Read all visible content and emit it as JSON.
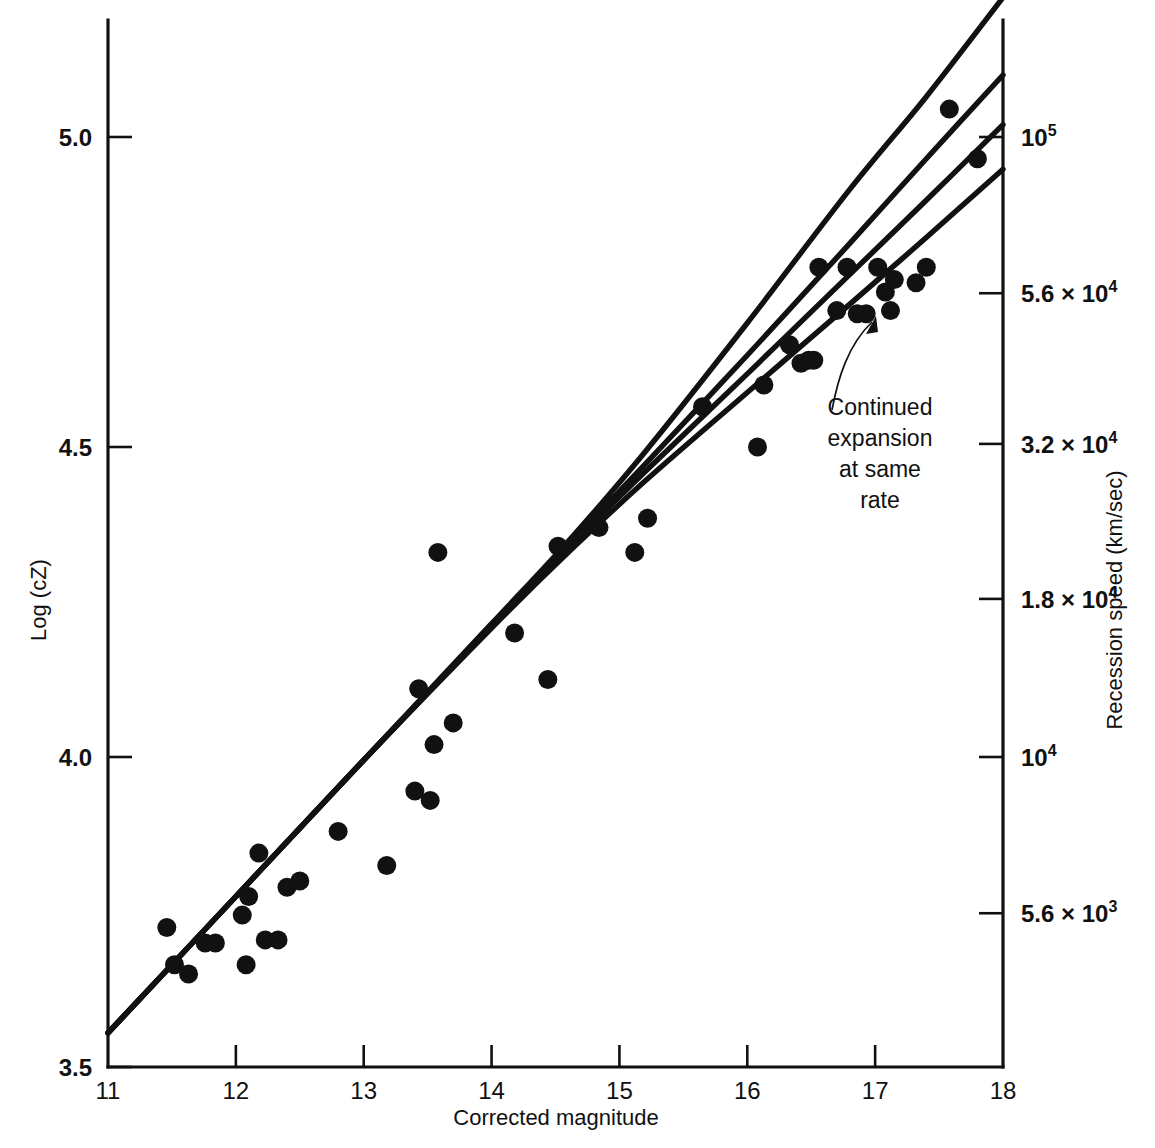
{
  "chart_data": {
    "type": "scatter",
    "title": "",
    "xlabel": "Corrected magnitude",
    "ylabel": "Log (cZ)",
    "ylabel_right": "Recession speed (km/sec)",
    "xlim": [
      11,
      18
    ],
    "ylim": [
      3.5,
      5.15
    ],
    "grid": false,
    "legend_position": "none",
    "xticks": [
      "11",
      "12",
      "13",
      "14",
      "15",
      "16",
      "17",
      "18"
    ],
    "xtick_values": [
      11,
      12,
      13,
      14,
      15,
      16,
      17,
      18
    ],
    "yticks": [
      "3.5",
      "4.0",
      "4.5",
      "5.0"
    ],
    "ytick_values": [
      3.5,
      4.0,
      4.5,
      5.0
    ],
    "right_ticks": [
      {
        "mantissa": "5.6 × 10",
        "exponent": "3",
        "label": "5.6 × 10³",
        "log_value": 3.748
      },
      {
        "mantissa": "10",
        "exponent": "4",
        "label": "10⁴",
        "log_value": 4.0
      },
      {
        "mantissa": "1.8 × 10",
        "exponent": "4",
        "label": "1.8 × 10⁴",
        "log_value": 4.255
      },
      {
        "mantissa": "3.2 × 10",
        "exponent": "4",
        "label": "3.2 × 10⁴",
        "log_value": 4.505
      },
      {
        "mantissa": "5.6 × 10",
        "exponent": "4",
        "label": "5.6 × 10⁴",
        "log_value": 4.748
      },
      {
        "mantissa": "10",
        "exponent": "5",
        "label": "10⁵",
        "log_value": 5.0
      }
    ],
    "points": [
      {
        "x": 11.46,
        "y": 3.725
      },
      {
        "x": 11.52,
        "y": 3.665
      },
      {
        "x": 11.63,
        "y": 3.65
      },
      {
        "x": 11.76,
        "y": 3.7
      },
      {
        "x": 11.84,
        "y": 3.7
      },
      {
        "x": 12.05,
        "y": 3.745
      },
      {
        "x": 12.08,
        "y": 3.665
      },
      {
        "x": 12.1,
        "y": 3.775
      },
      {
        "x": 12.18,
        "y": 3.845
      },
      {
        "x": 12.23,
        "y": 3.705
      },
      {
        "x": 12.33,
        "y": 3.705
      },
      {
        "x": 12.4,
        "y": 3.79
      },
      {
        "x": 12.5,
        "y": 3.8
      },
      {
        "x": 12.8,
        "y": 3.88
      },
      {
        "x": 13.18,
        "y": 3.825
      },
      {
        "x": 13.4,
        "y": 3.945
      },
      {
        "x": 13.43,
        "y": 4.11
      },
      {
        "x": 13.52,
        "y": 3.93
      },
      {
        "x": 13.55,
        "y": 4.02
      },
      {
        "x": 13.58,
        "y": 4.33
      },
      {
        "x": 13.7,
        "y": 4.055
      },
      {
        "x": 14.18,
        "y": 4.2
      },
      {
        "x": 14.44,
        "y": 4.125
      },
      {
        "x": 14.52,
        "y": 4.34
      },
      {
        "x": 14.84,
        "y": 4.37
      },
      {
        "x": 15.12,
        "y": 4.33
      },
      {
        "x": 15.22,
        "y": 4.385
      },
      {
        "x": 15.65,
        "y": 4.565
      },
      {
        "x": 16.08,
        "y": 4.5
      },
      {
        "x": 16.13,
        "y": 4.6
      },
      {
        "x": 16.33,
        "y": 4.665
      },
      {
        "x": 16.42,
        "y": 4.635
      },
      {
        "x": 16.48,
        "y": 4.64
      },
      {
        "x": 16.52,
        "y": 4.64
      },
      {
        "x": 16.56,
        "y": 4.79
      },
      {
        "x": 16.7,
        "y": 4.72
      },
      {
        "x": 16.78,
        "y": 4.79
      },
      {
        "x": 16.86,
        "y": 4.715
      },
      {
        "x": 16.93,
        "y": 4.715
      },
      {
        "x": 17.02,
        "y": 4.79
      },
      {
        "x": 17.08,
        "y": 4.75
      },
      {
        "x": 17.12,
        "y": 4.72
      },
      {
        "x": 17.15,
        "y": 4.77
      },
      {
        "x": 17.32,
        "y": 4.765
      },
      {
        "x": 17.4,
        "y": 4.79
      },
      {
        "x": 17.58,
        "y": 5.045
      },
      {
        "x": 17.8,
        "y": 4.965
      }
    ],
    "curves": [
      {
        "name": "upper-model-curve",
        "points": [
          [
            11.0,
            3.555
          ],
          [
            12.0,
            3.775
          ],
          [
            13.0,
            3.995
          ],
          [
            14.0,
            4.215
          ],
          [
            14.6,
            4.348
          ],
          [
            15.2,
            4.492
          ],
          [
            16.0,
            4.7
          ],
          [
            16.8,
            4.915
          ],
          [
            17.4,
            5.065
          ],
          [
            18.0,
            5.225
          ]
        ]
      },
      {
        "name": "second-model-curve",
        "points": [
          [
            11.0,
            3.555
          ],
          [
            12.0,
            3.775
          ],
          [
            13.0,
            3.995
          ],
          [
            14.0,
            4.212
          ],
          [
            14.6,
            4.342
          ],
          [
            15.2,
            4.472
          ],
          [
            16.0,
            4.648
          ],
          [
            16.8,
            4.828
          ],
          [
            17.4,
            4.965
          ],
          [
            18.0,
            5.1
          ]
        ]
      },
      {
        "name": "third-model-curve",
        "points": [
          [
            11.0,
            3.555
          ],
          [
            12.0,
            3.775
          ],
          [
            13.0,
            3.995
          ],
          [
            14.0,
            4.21
          ],
          [
            14.6,
            4.338
          ],
          [
            15.2,
            4.46
          ],
          [
            16.0,
            4.618
          ],
          [
            16.8,
            4.778
          ],
          [
            17.4,
            4.898
          ],
          [
            18.0,
            5.02
          ]
        ]
      },
      {
        "name": "continued-expansion-curve",
        "points": [
          [
            11.0,
            3.555
          ],
          [
            12.0,
            3.775
          ],
          [
            13.0,
            3.995
          ],
          [
            14.0,
            4.208
          ],
          [
            14.6,
            4.33
          ],
          [
            15.2,
            4.445
          ],
          [
            16.0,
            4.588
          ],
          [
            16.8,
            4.73
          ],
          [
            17.4,
            4.838
          ],
          [
            18.0,
            4.948
          ]
        ]
      }
    ],
    "annotations": [
      {
        "name": "continued-expansion-annotation",
        "lines": [
          "Continued",
          "expansion",
          "at same",
          "rate"
        ],
        "text": "Continued expansion at same rate",
        "points_to": {
          "x": 16.7,
          "y": 4.635
        }
      }
    ],
    "colors": {
      "ink": "#111111",
      "background": "#ffffff"
    }
  }
}
